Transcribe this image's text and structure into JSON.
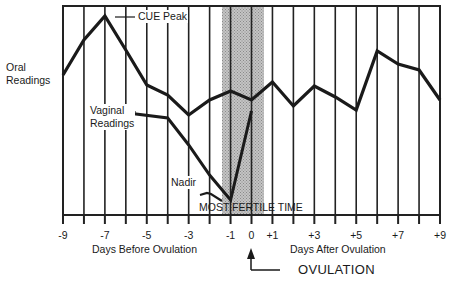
{
  "chart_data": {
    "type": "line",
    "title": "",
    "xlabel_left": "Days Before Ovulation",
    "xlabel_right": "Days After Ovulation",
    "ylabel": "Oral Readings",
    "x": [
      -9,
      -8,
      -7,
      -6,
      -5,
      -4,
      -3,
      -2,
      -1,
      0,
      1,
      2,
      3,
      4,
      5,
      6,
      7,
      8,
      9
    ],
    "xlim": [
      -9,
      9
    ],
    "tick_labels": [
      "-9",
      "-7",
      "-5",
      "-3",
      "-1",
      "0",
      "+1",
      "+3",
      "+5",
      "+7",
      "+9"
    ],
    "tick_values": [
      -9,
      -7,
      -5,
      -3,
      -1,
      0,
      1,
      3,
      5,
      7,
      9
    ],
    "grid": "vertical lines at every day",
    "y_units": "relative (no numeric scale shown); larger = higher reading",
    "series": [
      {
        "name": "Oral Readings",
        "x": [
          -9,
          -8,
          -7,
          -6,
          -5,
          -4,
          -3,
          -2,
          -1,
          0,
          1,
          2,
          3,
          4,
          5,
          6,
          7,
          8,
          9
        ],
        "values": [
          67,
          84,
          96,
          79,
          62,
          57,
          48,
          55,
          59,
          55,
          64,
          52,
          62,
          57,
          50,
          79,
          73,
          70,
          55
        ],
        "pixel_y": [
          75,
          40,
          16,
          50,
          85,
          95,
          115,
          100,
          91,
          100,
          82,
          106,
          86,
          97,
          110,
          51,
          64,
          70,
          100
        ]
      },
      {
        "name": "Vaginal Readings",
        "x": [
          -5.9,
          -4,
          -3,
          -2,
          -1,
          0
        ],
        "values": [
          51,
          49,
          36,
          22,
          10,
          53
        ],
        "pixel_y": [
          113,
          118,
          145,
          175,
          200,
          111
        ]
      }
    ],
    "annotations": [
      {
        "text": "CUE Peak",
        "at_x": -7,
        "series": "Oral Readings"
      },
      {
        "text": "Nadir",
        "at_x": -1,
        "series": "Vaginal Readings"
      },
      {
        "text": "MOST FERTILE TIME",
        "shaded_range": [
          -1.4,
          0.6
        ]
      },
      {
        "text": "OVULATION",
        "at_x": 0,
        "arrow": "up"
      }
    ]
  },
  "labels": {
    "oral_line1": "Oral",
    "oral_line2": "Readings",
    "vaginal_line1": "Vaginal",
    "vaginal_line2": "Readings",
    "cue_peak": "CUE Peak",
    "nadir": "Nadir",
    "most_fertile": "MOST FERTILE TIME",
    "days_before": "Days Before Ovulation",
    "days_after": "Days After Ovulation",
    "ovulation": "OVULATION"
  },
  "ticks": [
    "-9",
    "-7",
    "-5",
    "-3",
    "-1",
    "0",
    "+1",
    "+3",
    "+5",
    "+7",
    "+9"
  ],
  "colors": {
    "line": "#1a1a1a",
    "shade": "#b8b8b8",
    "grid": "#222222"
  }
}
